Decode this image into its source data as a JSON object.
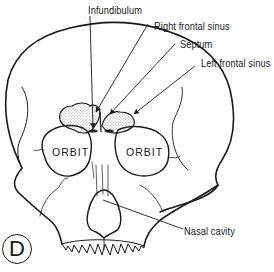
{
  "figure": {
    "panel_letter": "D",
    "line_color": "#1a1a1a",
    "sinus_fill": "#e6e6e6"
  },
  "labels": {
    "infundibulum": "Infundibulum",
    "right_frontal_sinus": "Right frontal sinus",
    "septum": "Septum",
    "left_frontal_sinus": "Left frontal sinus",
    "nasal_cavity": "Nasal cavity",
    "orbit_right": "ORBIT",
    "orbit_left": "ORBIT"
  }
}
